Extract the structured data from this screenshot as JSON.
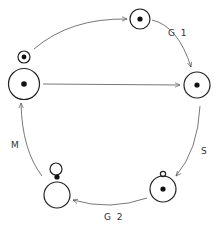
{
  "diagram": {
    "type": "cell-cycle",
    "phases": [
      {
        "id": "g1",
        "label": "G 1"
      },
      {
        "id": "s",
        "label": "S"
      },
      {
        "id": "g2",
        "label": "G 2"
      },
      {
        "id": "m",
        "label": "M"
      }
    ],
    "colors": {
      "stroke": "#222222",
      "arrow": "#555555",
      "label": "#333333",
      "background": "#ffffff"
    }
  }
}
